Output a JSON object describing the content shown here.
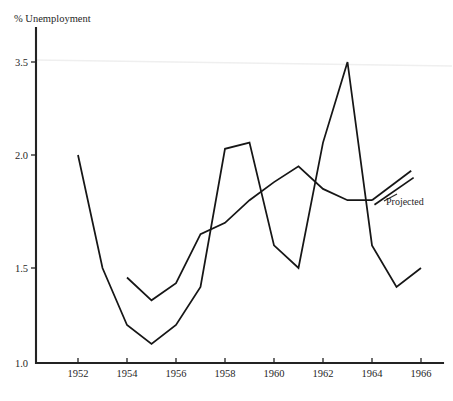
{
  "chart_data": {
    "type": "line",
    "title": "% Unemployment",
    "xlabel": "",
    "ylabel": "% Unemployment",
    "grid": false,
    "legend_position": "inline-annotation",
    "x": [
      1952,
      1953,
      1954,
      1955,
      1956,
      1957,
      1958,
      1959,
      1960,
      1961,
      1962,
      1963,
      1964,
      1965,
      1966
    ],
    "xlim": [
      1951,
      1967
    ],
    "ylim": [
      1.0,
      3.7
    ],
    "x_tick_labels": [
      "1952",
      "1954",
      "1956",
      "1958",
      "1960",
      "1962",
      "1964",
      "1966"
    ],
    "x_tick_values": [
      1952,
      1954,
      1956,
      1958,
      1960,
      1962,
      1964,
      1966
    ],
    "y_tick_labels": [
      "1.0",
      "1.5",
      "2.0",
      "3.5"
    ],
    "y_tick_values": [
      1.0,
      1.5,
      2.0,
      3.5
    ],
    "series": [
      {
        "name": "Actual",
        "points": [
          {
            "x": 1952,
            "y": 2.0
          },
          {
            "x": 1953,
            "y": 1.5
          },
          {
            "x": 1954,
            "y": 1.2
          },
          {
            "x": 1955,
            "y": 1.1
          },
          {
            "x": 1956,
            "y": 1.2
          },
          {
            "x": 1957,
            "y": 1.4
          },
          {
            "x": 1958,
            "y": 2.1
          },
          {
            "x": 1959,
            "y": 2.2
          },
          {
            "x": 1960,
            "y": 1.6
          },
          {
            "x": 1961,
            "y": 1.5
          },
          {
            "x": 1962,
            "y": 2.2
          },
          {
            "x": 1963,
            "y": 3.5
          },
          {
            "x": 1964,
            "y": 1.6
          },
          {
            "x": 1965,
            "y": 1.4
          },
          {
            "x": 1966,
            "y": 1.5
          }
        ]
      },
      {
        "name": "Projected",
        "points": [
          {
            "x": 1954,
            "y": 1.45
          },
          {
            "x": 1955,
            "y": 1.33
          },
          {
            "x": 1956,
            "y": 1.42
          },
          {
            "x": 1957,
            "y": 1.65
          },
          {
            "x": 1958,
            "y": 1.7
          },
          {
            "x": 1959,
            "y": 1.8
          },
          {
            "x": 1960,
            "y": 1.88
          },
          {
            "x": 1961,
            "y": 1.95
          },
          {
            "x": 1962,
            "y": 1.85
          },
          {
            "x": 1963,
            "y": 1.8
          },
          {
            "x": 1964,
            "y": 1.8
          }
        ],
        "projection_branches": [
          [
            {
              "x": 1964,
              "y": 1.8
            },
            {
              "x": 1965.6,
              "y": 1.93
            }
          ],
          [
            {
              "x": 1964.1,
              "y": 1.78
            },
            {
              "x": 1965.7,
              "y": 1.9
            }
          ]
        ]
      }
    ],
    "annotations": [
      {
        "label": "Projected",
        "x": 1966.0,
        "y": 1.79
      }
    ]
  },
  "axis": {
    "y_axis_title": "% Unemployment"
  },
  "colors": {
    "line": "#161616",
    "axis": "#232323",
    "background": "#ffffff",
    "scanline": "#efefef"
  }
}
